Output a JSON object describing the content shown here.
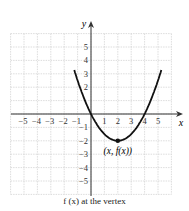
{
  "chart_data": {
    "type": "line",
    "title": "",
    "function": "f(x) = 0.5x^2 - 2x",
    "series": [
      {
        "name": "f(x)",
        "x": [
          -1.2,
          -1,
          0,
          1,
          2,
          3,
          4,
          5,
          5.2
        ],
        "y": [
          3.12,
          2.5,
          0,
          -1.5,
          -2,
          -1.5,
          0,
          2.5,
          3.12
        ]
      }
    ],
    "vertex": {
      "x": 2,
      "y": -2,
      "label": "(x, f(x))"
    },
    "xlabel": "x",
    "ylabel": "y",
    "xlim": [
      -6,
      6
    ],
    "ylim": [
      -6,
      6
    ],
    "x_ticks": [
      "-5",
      "-4",
      "-3",
      "-2",
      "-1",
      "1",
      "2",
      "3",
      "4",
      "5"
    ],
    "y_ticks": [
      "5",
      "4",
      "3",
      "2",
      "-1",
      "-2",
      "-3",
      "-4",
      "-5"
    ],
    "grid": true
  },
  "caption": "f (x) at the vertex",
  "labels": {
    "x_axis": "x",
    "y_axis": "y",
    "vertex_label": "(x, f(x))"
  }
}
